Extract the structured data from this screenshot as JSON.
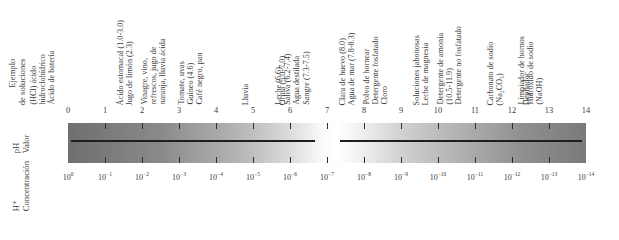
{
  "axis_titles": {
    "example": [
      "Ejemplo",
      "de soluciones"
    ],
    "ph": [
      "pH",
      "Valor"
    ],
    "concentration": [
      "H⁺",
      "Concentración"
    ]
  },
  "ph_scale": {
    "values": [
      "0",
      "1",
      "2",
      "3",
      "4",
      "5",
      "6",
      "7",
      "8",
      "9",
      "10",
      "11",
      "12",
      "13",
      "14"
    ],
    "concentrations": [
      "10",
      "10",
      "10",
      "10",
      "10",
      "10",
      "10",
      "10",
      "10",
      "10",
      "10",
      "10",
      "10",
      "10",
      "10"
    ],
    "exponents": [
      "0",
      "−1",
      "−2",
      "−3",
      "−4",
      "−5",
      "−6",
      "−7",
      "−8",
      "−9",
      "−10",
      "−11",
      "−12",
      "−13",
      "−14"
    ],
    "colors": {
      "acid_end": "#6f6f6f",
      "neutral": "#ffffff",
      "base_end": "#7a7a7a",
      "line": "#1e1e1e"
    }
  },
  "examples": [
    {
      "ph_pos": 0,
      "lines": [
        "(HCl) ácido",
        "hidroclohídrico",
        "Ácido de batería"
      ]
    },
    {
      "ph_pos": 2,
      "lines": [
        "Ácido estomacal (1.0-3.0)",
        "Jugo de limón (2.3)"
      ]
    },
    {
      "ph_pos": 3,
      "lines": [
        "Vinagre, vino,",
        "refrescos, jugo de",
        "naranja, lluvia ácida"
      ]
    },
    {
      "ph_pos": 4,
      "lines": [
        "Tomate, uvas",
        "Guineo (4.6)",
        "Café negro, pan"
      ]
    },
    {
      "ph_pos": 5,
      "lines": [
        "Lluvia"
      ]
    },
    {
      "ph_pos": 6,
      "lines": [
        "Orina (5.0-7.0)"
      ]
    },
    {
      "ph_pos": 7,
      "lines": [
        "Leche (6.6)",
        "Saliva (6.2-7.4)",
        "Agua destilada",
        "Sangre (7.3-7.5)"
      ]
    },
    {
      "ph_pos": 8,
      "lines": [
        "Clara de huevo (8.0)",
        "Agua de mar (7.8-8.3)"
      ]
    },
    {
      "ph_pos": 9,
      "lines": [
        "Polvo de hornear",
        "Detergente fosfatado",
        "Cloro"
      ]
    },
    {
      "ph_pos": 10,
      "lines": [
        "Soluciones jabonosas",
        "Leche de magnesia"
      ]
    },
    {
      "ph_pos": 11,
      "lines": [
        "Detergente de amonia",
        "(10.5-11.9)",
        "Detergente no fosfatado"
      ]
    },
    {
      "ph_pos": 12,
      "lines": [
        "Carbonato de sodio",
        "(Na₂CO₃)"
      ]
    },
    {
      "ph_pos": 12.6,
      "lines": [
        "Depilador"
      ]
    },
    {
      "ph_pos": 13.2,
      "lines": [
        "Limpiador de  hornos",
        "Hidróxido de sodio",
        "(NaOH)"
      ]
    }
  ]
}
